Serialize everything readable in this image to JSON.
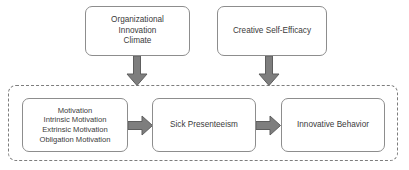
{
  "diagram": {
    "type": "flow-diagram",
    "background_color": "#ffffff",
    "box_border_color": "#8d8d8d",
    "text_color": "#3b3b3b",
    "arrow_color": "#7e7e7e",
    "dashed_border_color": "#7d7d7d",
    "top_boxes": [
      {
        "id": "organizational-innovation-climate",
        "lines": [
          "Organizational",
          "Innovation",
          "Climate"
        ]
      },
      {
        "id": "creative-self-efficacy",
        "lines": [
          "Creative Self-Efficacy"
        ]
      }
    ],
    "inner_boxes": [
      {
        "id": "motivation",
        "lines": [
          "Motivation",
          "Intrinsic Motivation",
          "Extrinsic Motivation",
          "Obligation Motivation"
        ]
      },
      {
        "id": "sick-presenteeism",
        "lines": [
          "Sick Presenteeism"
        ]
      },
      {
        "id": "innovative-behavior",
        "lines": [
          "Innovative Behavior"
        ]
      }
    ],
    "arrows": [
      {
        "id": "climate-to-region",
        "icon": "arrow-down-icon",
        "direction": "down",
        "from": "organizational-innovation-climate",
        "to": "dashed-region"
      },
      {
        "id": "efficacy-to-region",
        "icon": "arrow-down-icon",
        "direction": "down",
        "from": "creative-self-efficacy",
        "to": "dashed-region"
      },
      {
        "id": "motivation-to-presenteeism",
        "icon": "arrow-right-icon",
        "direction": "right",
        "from": "motivation",
        "to": "sick-presenteeism"
      },
      {
        "id": "presenteeism-to-innovative",
        "icon": "arrow-right-icon",
        "direction": "right",
        "from": "sick-presenteeism",
        "to": "innovative-behavior"
      }
    ]
  }
}
